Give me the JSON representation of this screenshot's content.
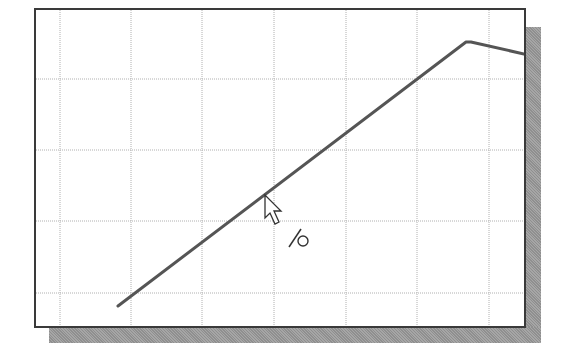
{
  "screen": {
    "description": "CAD sketch viewport with grid, a polyline being drawn, and a cursor with a point-on-line snap indicator"
  },
  "viewport": {
    "frame": {
      "left": 34,
      "top": 8,
      "right": 524,
      "bottom": 326
    },
    "border_color": "#3a3a3a",
    "background": "#ffffff",
    "shadow_color": "#999999"
  },
  "grid": {
    "color": "#b0b0b0",
    "style": "dotted",
    "vertical_lines_x": [
      60,
      131,
      202,
      274,
      346,
      417,
      489
    ],
    "horizontal_lines_y": [
      79,
      150,
      221,
      293
    ]
  },
  "sketch": {
    "line_color": "#555555",
    "line_width": 3,
    "polyline_points": [
      {
        "x": 118,
        "y": 306
      },
      {
        "x": 466,
        "y": 42
      },
      {
        "x": 471,
        "y": 42
      },
      {
        "x": 524,
        "y": 54
      }
    ]
  },
  "cursor": {
    "icon": "arrow-pointer-icon",
    "tip": {
      "x": 265,
      "y": 195
    }
  },
  "snap_indicator": {
    "icon": "point-on-line-constraint-icon",
    "label": "/○",
    "position": {
      "x": 286,
      "y": 226
    }
  }
}
